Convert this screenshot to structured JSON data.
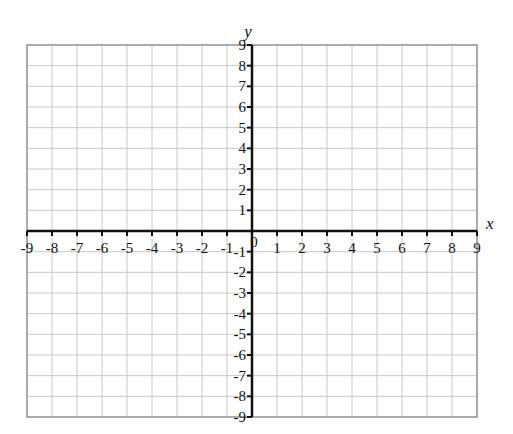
{
  "chart_data": {
    "type": "scatter",
    "title": "",
    "xlabel": "x",
    "ylabel": "y",
    "xlim": [
      -9,
      9
    ],
    "ylim": [
      -9,
      9
    ],
    "grid": true,
    "x_ticks": [
      "-9",
      "-8",
      "-7",
      "-6",
      "-5",
      "-4",
      "-3",
      "-2",
      "-1",
      "1",
      "2",
      "3",
      "4",
      "5",
      "6",
      "7",
      "8",
      "9"
    ],
    "y_ticks": [
      "9",
      "8",
      "7",
      "6",
      "5",
      "4",
      "3",
      "2",
      "1",
      "-1",
      "-2",
      "-3",
      "-4",
      "-5",
      "-6",
      "-7",
      "-8",
      "-9"
    ],
    "origin_label": "0",
    "series": []
  },
  "colors": {
    "grid": "#c8c8c8",
    "axis": "#111111",
    "border": "#999999"
  }
}
